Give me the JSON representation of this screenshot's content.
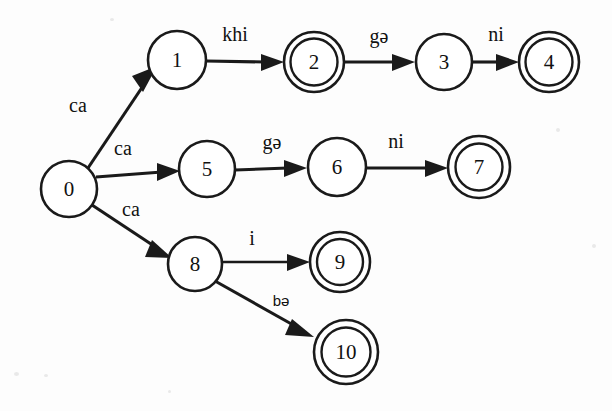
{
  "diagram": {
    "type": "finite-state-automaton",
    "ink_color": "#1a1a1a",
    "background_color": "#fdfdfd",
    "states": [
      {
        "id": "0",
        "label": "0",
        "kind": "start",
        "accepting": false,
        "cx": 69,
        "cy": 189,
        "r": 28
      },
      {
        "id": "1",
        "label": "1",
        "kind": "normal",
        "accepting": false,
        "cx": 177,
        "cy": 60,
        "r": 29
      },
      {
        "id": "2",
        "label": "2",
        "kind": "accepting",
        "accepting": true,
        "cx": 314,
        "cy": 62,
        "r": 30
      },
      {
        "id": "3",
        "label": "3",
        "kind": "normal",
        "accepting": false,
        "cx": 444,
        "cy": 62,
        "r": 28
      },
      {
        "id": "4",
        "label": "4",
        "kind": "accepting",
        "accepting": true,
        "cx": 549,
        "cy": 62,
        "r": 30
      },
      {
        "id": "5",
        "label": "5",
        "kind": "normal",
        "accepting": false,
        "cx": 207,
        "cy": 169,
        "r": 28
      },
      {
        "id": "6",
        "label": "6",
        "kind": "normal",
        "accepting": false,
        "cx": 337,
        "cy": 167,
        "r": 29
      },
      {
        "id": "7",
        "label": "7",
        "kind": "accepting",
        "accepting": true,
        "cx": 479,
        "cy": 167,
        "r": 31
      },
      {
        "id": "8",
        "label": "8",
        "kind": "normal",
        "accepting": false,
        "cx": 195,
        "cy": 264,
        "r": 27
      },
      {
        "id": "9",
        "label": "9",
        "kind": "accepting",
        "accepting": true,
        "cx": 340,
        "cy": 262,
        "r": 30
      },
      {
        "id": "10",
        "label": "10",
        "kind": "accepting",
        "accepting": true,
        "cx": 346,
        "cy": 352,
        "r": 32
      }
    ],
    "transitions": [
      {
        "from": "0",
        "to": "1",
        "label": "ca",
        "label_x": 78,
        "label_y": 112,
        "style": "serif"
      },
      {
        "from": "0",
        "to": "5",
        "label": "ca",
        "label_x": 123,
        "label_y": 155,
        "style": "serif"
      },
      {
        "from": "0",
        "to": "8",
        "label": "ca",
        "label_x": 131,
        "label_y": 216,
        "style": "serif"
      },
      {
        "from": "1",
        "to": "2",
        "label": "khi",
        "label_x": 235,
        "label_y": 41,
        "style": "serif"
      },
      {
        "from": "2",
        "to": "3",
        "label": "gə",
        "label_x": 379,
        "label_y": 43,
        "style": "serif"
      },
      {
        "from": "3",
        "to": "4",
        "label": "ni",
        "label_x": 496,
        "label_y": 41,
        "style": "serif"
      },
      {
        "from": "5",
        "to": "6",
        "label": "gə",
        "label_x": 272,
        "label_y": 149,
        "style": "serif"
      },
      {
        "from": "6",
        "to": "7",
        "label": "ni",
        "label_x": 396,
        "label_y": 148,
        "style": "serif"
      },
      {
        "from": "8",
        "to": "9",
        "label": "i",
        "label_x": 252,
        "label_y": 245,
        "style": "serif"
      },
      {
        "from": "8",
        "to": "10",
        "label": "bə",
        "label_x": 281,
        "label_y": 306,
        "style": "sans"
      }
    ]
  }
}
